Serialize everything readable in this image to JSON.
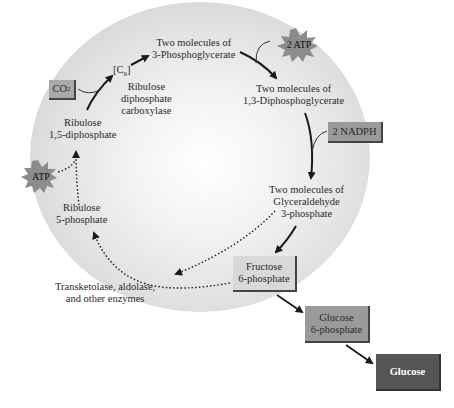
{
  "diagram": {
    "nodes": {
      "pga": {
        "line1": "Two molecules of",
        "line2": "3-Phosphoglycerate"
      },
      "dpg": {
        "line1": "Two molecules of",
        "line2": "1,3-Diphosphoglycerate"
      },
      "g3p": {
        "line1": "Two molecules of",
        "line2": "Glyceraldehyde",
        "line3": "3-phosphate"
      },
      "f6p": {
        "line1": "Fructose",
        "line2": "6-phosphate"
      },
      "g6p": {
        "line1": "Glucose",
        "line2": "6-phosphate"
      },
      "glucose": {
        "label": "Glucose"
      },
      "ru5p": {
        "line1": "Ribulose",
        "line2": "5-phosphate"
      },
      "rudp": {
        "line1": "Ribulose",
        "line2": "1,5-diphosphate"
      },
      "c6": {
        "label": "[C",
        "sub": "6",
        "close": "]"
      }
    },
    "inputs": {
      "co2": {
        "label": "CO",
        "sub": "2"
      },
      "atp2": {
        "label": "2 ATP"
      },
      "nadph": {
        "label": "2 NADPH"
      },
      "atp": {
        "label": "ATP"
      }
    },
    "enzymes": {
      "rubisco": {
        "line1": "Ribulose",
        "line2": "diphosphate",
        "line3": "carboxylase"
      },
      "regen": {
        "line1": "Transketolase, aldolase,",
        "line2": "and other enzymes"
      }
    },
    "colors": {
      "light_box": "#d9d9d9",
      "mid_box": "#9a9a9a",
      "dark_box": "#555555",
      "burst": "#8c8c8c",
      "arrow": "#1a1a1a"
    }
  }
}
